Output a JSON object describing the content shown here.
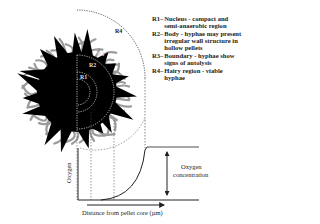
{
  "figure": {
    "region_labels": [
      "R1",
      "R2",
      "R3",
      "R4"
    ],
    "legend": [
      {
        "key": "R1",
        "separator": "–",
        "text": "Nucleus - compact and semi-anaerobic region"
      },
      {
        "key": "R2",
        "separator": "–",
        "text": "Body - hyphae may present irregular wall structure in hollow pellets"
      },
      {
        "key": "R3",
        "separator": "–",
        "text": "Boundary - hyphae show signs of autolysis"
      },
      {
        "key": "R4",
        "separator": "–",
        "text": "Hairy region - viable hyphae"
      }
    ],
    "graph": {
      "ylabel": "Oxygen",
      "xlabel": "Distance from pellet core (µm)",
      "annotation": [
        "Oxygen",
        "concentration"
      ]
    }
  }
}
